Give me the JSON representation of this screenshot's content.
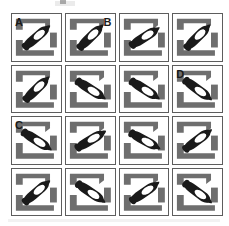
{
  "figure": {
    "rows": 4,
    "columns": 4,
    "colors": {
      "frame_gray": "#6e6e6e",
      "pen_black": "#1a1a1a",
      "cell_border": "#5d5d5d",
      "background": "#ffffff",
      "pen_highlight": "#ffffff"
    }
  },
  "cells": [
    {
      "id": "r1c1",
      "row": 1,
      "col": 1,
      "label": "A",
      "label_position": "top-left",
      "pen_rotation": -42,
      "pen_tip": "upper-right",
      "frame_style": "brackets-tl-br"
    },
    {
      "id": "r1c2",
      "row": 1,
      "col": 2,
      "label": "B",
      "label_position": "top-right",
      "pen_rotation": -46,
      "pen_tip": "upper-right",
      "frame_style": "brackets-tl-br"
    },
    {
      "id": "r1c3",
      "row": 1,
      "col": 3,
      "label": "",
      "label_position": "",
      "pen_rotation": -34,
      "pen_tip": "upper-right",
      "frame_style": "brackets-tl-br"
    },
    {
      "id": "r1c4",
      "row": 1,
      "col": 4,
      "label": "",
      "label_position": "",
      "pen_rotation": -46,
      "pen_tip": "upper-right",
      "frame_style": "brackets-tl-br"
    },
    {
      "id": "r2c1",
      "row": 2,
      "col": 1,
      "label": "",
      "label_position": "",
      "pen_rotation": -46,
      "pen_tip": "upper-right",
      "frame_style": "brackets-tl-br"
    },
    {
      "id": "r2c2",
      "row": 2,
      "col": 2,
      "label": "",
      "label_position": "",
      "pen_rotation": 34,
      "pen_tip": "lower-right",
      "frame_style": "brackets-tl-br"
    },
    {
      "id": "r2c3",
      "row": 2,
      "col": 3,
      "label": "",
      "label_position": "",
      "pen_rotation": 34,
      "pen_tip": "lower-right",
      "frame_style": "brackets-tl-br"
    },
    {
      "id": "r2c4",
      "row": 2,
      "col": 4,
      "label": "D",
      "label_position": "top-left",
      "pen_rotation": 38,
      "pen_tip": "lower-right",
      "frame_style": "brackets-tl-br"
    },
    {
      "id": "r3c1",
      "row": 3,
      "col": 1,
      "label": "C",
      "label_position": "top-left",
      "pen_rotation": 34,
      "pen_tip": "lower-right",
      "frame_style": "brackets-tl-br"
    },
    {
      "id": "r3c2",
      "row": 3,
      "col": 2,
      "label": "",
      "label_position": "",
      "pen_rotation": -32,
      "pen_tip": "upper-right",
      "frame_style": "brackets-tl-br"
    },
    {
      "id": "r3c3",
      "row": 3,
      "col": 3,
      "label": "",
      "label_position": "",
      "pen_rotation": 30,
      "pen_tip": "lower-right",
      "frame_style": "brackets-tl-br"
    },
    {
      "id": "r3c4",
      "row": 3,
      "col": 4,
      "label": "",
      "label_position": "",
      "pen_rotation": -38,
      "pen_tip": "upper-right",
      "frame_style": "brackets-tl-br"
    },
    {
      "id": "r4c1",
      "row": 4,
      "col": 1,
      "label": "",
      "label_position": "",
      "pen_rotation": -42,
      "pen_tip": "upper-right",
      "frame_style": "brackets-tl-br"
    },
    {
      "id": "r4c2",
      "row": 4,
      "col": 2,
      "label": "",
      "label_position": "",
      "pen_rotation": 36,
      "pen_tip": "lower-right",
      "frame_style": "brackets-tl-br"
    },
    {
      "id": "r4c3",
      "row": 4,
      "col": 3,
      "label": "",
      "label_position": "",
      "pen_rotation": -36,
      "pen_tip": "upper-right",
      "frame_style": "brackets-tl-br"
    },
    {
      "id": "r4c4",
      "row": 4,
      "col": 4,
      "label": "",
      "label_position": "",
      "pen_rotation": 38,
      "pen_tip": "lower-right",
      "frame_style": "brackets-tl-br"
    }
  ]
}
